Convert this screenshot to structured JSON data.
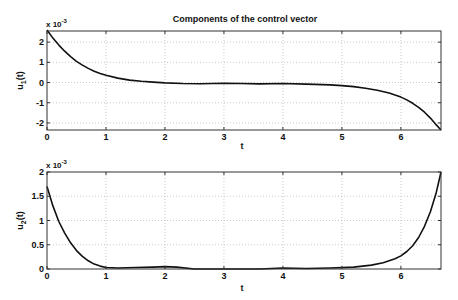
{
  "title": "Components of the control vector",
  "chart_data": [
    {
      "type": "line",
      "title": "Components of the control vector",
      "xlabel": "t",
      "ylabel": "u1(t)",
      "ylabel_main": "u",
      "ylabel_sub": "1",
      "ylabel_tail": "(t)",
      "exponent_label": "x 10",
      "exponent_power": "-3",
      "xlim": [
        0,
        6.68
      ],
      "ylim": [
        -2.35,
        2.55
      ],
      "xticks": [
        0,
        1,
        2,
        3,
        4,
        5,
        6
      ],
      "yticks": [
        -2,
        -1,
        0,
        1,
        2
      ],
      "grid": true,
      "series": [
        {
          "name": "u1(t)",
          "x": [
            0,
            0.1,
            0.2,
            0.3,
            0.4,
            0.5,
            0.6,
            0.7,
            0.8,
            0.9,
            1.0,
            1.2,
            1.4,
            1.6,
            1.8,
            2.0,
            2.3,
            2.6,
            3.0,
            3.3,
            3.6,
            4.0,
            4.4,
            4.8,
            5.0,
            5.2,
            5.4,
            5.6,
            5.8,
            6.0,
            6.1,
            6.2,
            6.3,
            6.4,
            6.5,
            6.6,
            6.68
          ],
          "y": [
            2.6,
            2.2,
            1.85,
            1.55,
            1.28,
            1.05,
            0.86,
            0.7,
            0.56,
            0.45,
            0.36,
            0.22,
            0.12,
            0.06,
            0.02,
            -0.02,
            -0.05,
            -0.06,
            -0.04,
            -0.05,
            -0.07,
            -0.05,
            -0.08,
            -0.12,
            -0.15,
            -0.2,
            -0.28,
            -0.38,
            -0.52,
            -0.72,
            -0.86,
            -1.03,
            -1.23,
            -1.47,
            -1.76,
            -2.1,
            -2.4
          ]
        }
      ]
    },
    {
      "type": "line",
      "xlabel": "t",
      "ylabel": "u2(t)",
      "ylabel_main": "u",
      "ylabel_sub": "2",
      "ylabel_tail": "(t)",
      "exponent_label": "x 10",
      "exponent_power": "-3",
      "xlim": [
        0,
        6.68
      ],
      "ylim": [
        0,
        2
      ],
      "xticks": [
        0,
        1,
        2,
        3,
        4,
        5,
        6
      ],
      "yticks": [
        0,
        0.5,
        1,
        1.5,
        2
      ],
      "grid": true,
      "series": [
        {
          "name": "u2(t)",
          "x": [
            0,
            0.1,
            0.2,
            0.3,
            0.4,
            0.5,
            0.6,
            0.7,
            0.8,
            0.9,
            1.0,
            1.2,
            1.5,
            1.8,
            2.0,
            2.2,
            2.5,
            2.8,
            3.2,
            3.6,
            4.0,
            4.4,
            4.8,
            5.2,
            5.5,
            5.7,
            5.9,
            6.0,
            6.1,
            6.2,
            6.3,
            6.4,
            6.5,
            6.6,
            6.68
          ],
          "y": [
            1.7,
            1.3,
            0.98,
            0.74,
            0.54,
            0.38,
            0.26,
            0.17,
            0.1,
            0.06,
            0.03,
            0.02,
            0.03,
            0.04,
            0.05,
            0.04,
            -0.01,
            -0.03,
            -0.03,
            -0.02,
            0.02,
            0.01,
            0.02,
            0.04,
            0.08,
            0.13,
            0.21,
            0.27,
            0.36,
            0.48,
            0.65,
            0.88,
            1.18,
            1.58,
            2.0
          ]
        }
      ]
    }
  ],
  "axes": [
    {
      "box": {
        "left": 47,
        "top": 31,
        "right": 441,
        "bottom": 130
      },
      "x_label_y": 149
    },
    {
      "box": {
        "left": 47,
        "top": 172,
        "right": 441,
        "bottom": 269
      },
      "x_label_y": 291
    }
  ],
  "colors": {
    "line": "#111111",
    "axis": "#333333",
    "grid": "#bdbdbd"
  }
}
